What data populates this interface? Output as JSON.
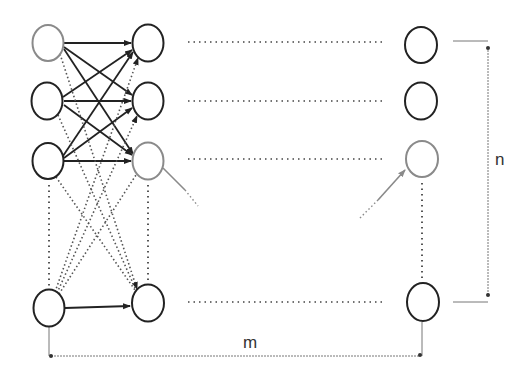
{
  "diagram": {
    "type": "neural-network-grid",
    "labels": {
      "rows": "n",
      "columns": "m"
    },
    "colors": {
      "node_stroke": "#222222",
      "highlight_node_stroke": "#8a8a8a",
      "solid_edge": "#222222",
      "dotted_edge": "#555555",
      "pointer_arrow": "#8a8a8a",
      "bracket": "#777777"
    },
    "columns": [
      {
        "id": "col-1",
        "x": 48,
        "nodes": [
          {
            "id": "c1-r1",
            "y": 43,
            "highlight": true
          },
          {
            "id": "c1-r2",
            "y": 101,
            "highlight": false
          },
          {
            "id": "c1-r3",
            "y": 161,
            "highlight": false
          },
          {
            "id": "c1-rn",
            "y": 308,
            "highlight": false
          }
        ]
      },
      {
        "id": "col-2",
        "x": 148,
        "nodes": [
          {
            "id": "c2-r1",
            "y": 43,
            "highlight": false
          },
          {
            "id": "c2-r2",
            "y": 101,
            "highlight": false
          },
          {
            "id": "c2-r3",
            "y": 161,
            "highlight": true
          },
          {
            "id": "c2-rn",
            "y": 303,
            "highlight": false
          }
        ]
      },
      {
        "id": "col-m",
        "x": 422,
        "nodes": [
          {
            "id": "cm-r1",
            "y": 45,
            "highlight": false
          },
          {
            "id": "cm-r2",
            "y": 101,
            "highlight": false
          },
          {
            "id": "cm-r3",
            "y": 159,
            "highlight": true
          },
          {
            "id": "cm-rn",
            "y": 302,
            "highlight": false
          }
        ]
      }
    ],
    "solid_edges": [
      [
        "c1-r1",
        "c2-r1"
      ],
      [
        "c1-r1",
        "c2-r2"
      ],
      [
        "c1-r1",
        "c2-r3"
      ],
      [
        "c1-r2",
        "c2-r1"
      ],
      [
        "c1-r2",
        "c2-r2"
      ],
      [
        "c1-r2",
        "c2-r3"
      ],
      [
        "c1-r3",
        "c2-r1"
      ],
      [
        "c1-r3",
        "c2-r2"
      ],
      [
        "c1-r3",
        "c2-r3"
      ],
      [
        "c1-rn",
        "c2-rn"
      ]
    ],
    "dotted_edges": [
      [
        "c1-r1",
        "c2-rn"
      ],
      [
        "c1-r2",
        "c2-rn"
      ],
      [
        "c1-r3",
        "c2-rn"
      ],
      [
        "c1-rn",
        "c2-r1"
      ],
      [
        "c1-rn",
        "c2-r2"
      ],
      [
        "c1-rn",
        "c2-r3"
      ]
    ]
  }
}
